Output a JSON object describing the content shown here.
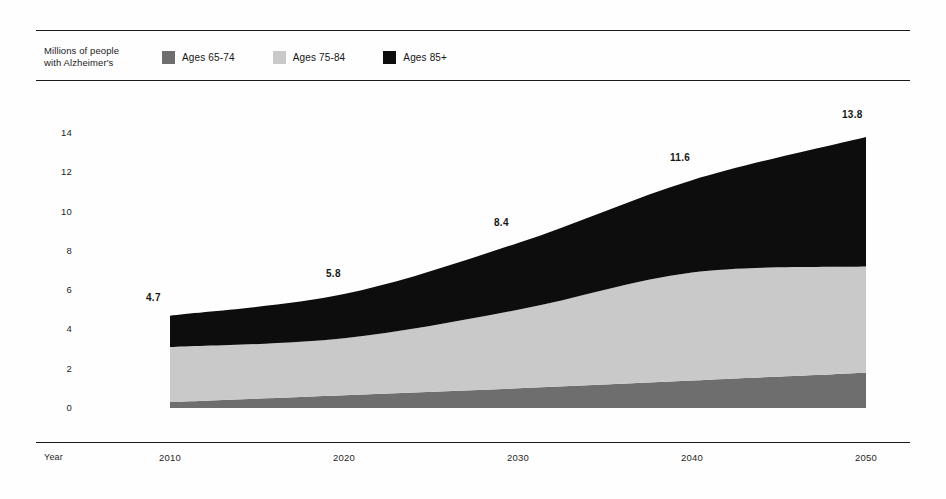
{
  "legend": {
    "caption_line1": "Millions of people",
    "caption_line2": "with Alzheimer's",
    "entries": [
      {
        "label": "Ages 65-74",
        "color": "#6e6e6e",
        "swatch_icon": "legend-swatch-icon"
      },
      {
        "label": "Ages 75-84",
        "color": "#c9c9c9",
        "swatch_icon": "legend-swatch-icon"
      },
      {
        "label": "Ages 85+",
        "color": "#0d0d0d",
        "swatch_icon": "legend-swatch-icon"
      }
    ]
  },
  "chart_data": {
    "type": "area",
    "stacked": true,
    "title": "",
    "subtitle": "",
    "xlabel": "Year",
    "ylabel": "Millions of people with Alzheimer's",
    "x": [
      2010,
      2020,
      2030,
      2040,
      2050
    ],
    "categories": [
      "2010",
      "2020",
      "2030",
      "2040",
      "2050"
    ],
    "xlim": [
      2010,
      2050
    ],
    "ylim": [
      0,
      14
    ],
    "yticks": [
      0,
      2,
      4,
      6,
      8,
      10,
      12,
      14
    ],
    "ytick_labels": [
      "0",
      "2",
      "4",
      "6",
      "8",
      "10",
      "12",
      "14"
    ],
    "xtick_labels": [
      "2010",
      "2020",
      "2030",
      "2040",
      "2050"
    ],
    "grid": false,
    "legend_position": "top",
    "series": [
      {
        "name": "Ages 65-74",
        "color": "#6e6e6e",
        "values": [
          0.3,
          0.65,
          1.0,
          1.4,
          1.8
        ]
      },
      {
        "name": "Ages 75-84",
        "color": "#c9c9c9",
        "values": [
          2.8,
          2.9,
          4.0,
          5.5,
          5.4
        ]
      },
      {
        "name": "Ages 85+",
        "color": "#0d0d0d",
        "values": [
          1.6,
          2.25,
          3.4,
          4.7,
          6.6
        ]
      }
    ],
    "totals": [
      4.7,
      5.8,
      8.4,
      11.6,
      13.8
    ],
    "annotations": [
      {
        "text": "4.7",
        "x": 2010
      },
      {
        "text": "5.8",
        "x": 2020
      },
      {
        "text": "8.4",
        "x": 2030
      },
      {
        "text": "11.6",
        "x": 2040
      },
      {
        "text": "13.8",
        "x": 2050
      }
    ]
  }
}
